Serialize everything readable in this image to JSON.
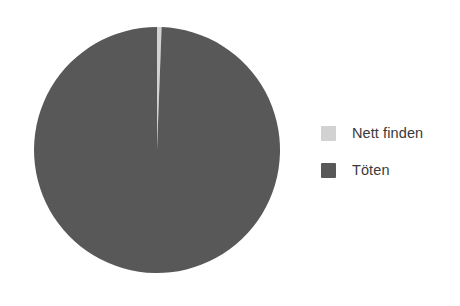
{
  "chart_data": {
    "type": "pie",
    "title": "",
    "subtitle": "",
    "xlabel": "",
    "ylabel": "",
    "grid": false,
    "legend_position": "right",
    "start_angle_deg": 0,
    "direction": "clockwise",
    "categories": [
      "Nett finden",
      "Töten"
    ],
    "values": [
      0.6,
      99.4
    ],
    "slices": [
      {
        "label": "Nett finden",
        "value": 0.6,
        "percent": 0.6,
        "color": "#d2d2d2"
      },
      {
        "label": "Töten",
        "value": 99.4,
        "percent": 99.4,
        "color": "#585858"
      }
    ],
    "annotations": []
  },
  "legend": {
    "items": [
      {
        "label": "Nett finden",
        "color": "#d2d2d2",
        "swatch_name": "legend-swatch-nett-finden"
      },
      {
        "label": "Töten",
        "color": "#585858",
        "swatch_name": "legend-swatch-toeten"
      }
    ]
  },
  "colors": {
    "background": "#ffffff",
    "text": "#3a3a3a",
    "slice_light": "#d2d2d2",
    "slice_dark": "#585858"
  },
  "geometry": {
    "center_x": 157,
    "center_y": 150,
    "radius": 123
  }
}
